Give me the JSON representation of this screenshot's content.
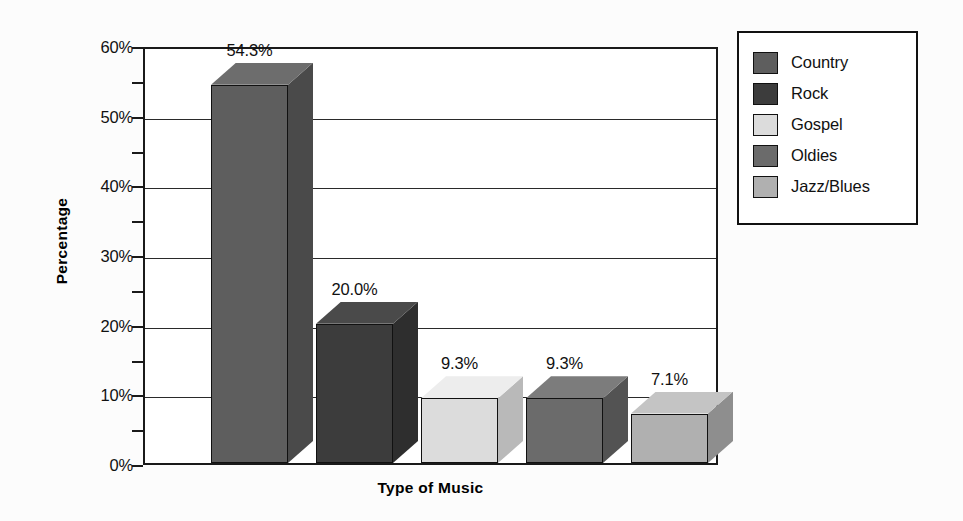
{
  "chart_data": {
    "type": "bar",
    "title": "",
    "xlabel": "Type of Music",
    "ylabel": "Percentage",
    "categories": [
      "Country",
      "Rock",
      "Gospel",
      "Oldies",
      "Jazz/Blues"
    ],
    "values": [
      54.3,
      20.0,
      9.3,
      9.3,
      7.1
    ],
    "data_labels": [
      "54.3%",
      "20.0%",
      "9.3%",
      "9.3%",
      "7.1%"
    ],
    "ylim": [
      0,
      60
    ],
    "ytick_labels": [
      "0%",
      "10%",
      "20%",
      "30%",
      "40%",
      "50%",
      "60%"
    ],
    "ytick_values": [
      0,
      10,
      20,
      30,
      40,
      50,
      60
    ],
    "yminor_tick_values": [
      5,
      15,
      25,
      35,
      45,
      55
    ],
    "grid": true,
    "legend_position": "right",
    "legend_entries": [
      {
        "label": "Country",
        "color": "#5e5e5e"
      },
      {
        "label": "Rock",
        "color": "#3c3c3c"
      },
      {
        "label": "Gospel",
        "color": "#dcdcdc"
      },
      {
        "label": "Oldies",
        "color": "#6b6b6b"
      },
      {
        "label": "Jazz/Blues",
        "color": "#b0b0b0"
      }
    ],
    "series_colors": [
      "#5e5e5e",
      "#3c3c3c",
      "#dcdcdc",
      "#6b6b6b",
      "#b0b0b0"
    ],
    "side_colors": [
      "#4a4a4a",
      "#2e2e2e",
      "#b9b9b9",
      "#535353",
      "#8e8e8e"
    ],
    "top_colors": [
      "#6d6d6d",
      "#4a4a4a",
      "#ededed",
      "#7c7c7c",
      "#c4c4c4"
    ]
  },
  "axes": {
    "y_title": "Percentage",
    "x_title": "Type of Music"
  }
}
